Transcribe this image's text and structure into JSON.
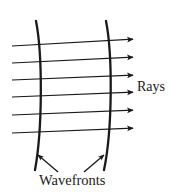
{
  "figure": {
    "background_color": "#ffffff",
    "ink_color": "#1a1a1a",
    "width": 171,
    "height": 192
  },
  "labels": {
    "rays": "Rays",
    "wavefronts": "Wavefronts"
  },
  "chart_data": {
    "type": "diagram",
    "elements": {
      "rays": {
        "count": 6,
        "direction": "left-to-right",
        "arrowhead": "right",
        "label": "Rays",
        "lines": [
          {
            "x1": 12,
            "y1": 46,
            "x2": 137,
            "y2": 39
          },
          {
            "x1": 12,
            "y1": 63,
            "x2": 137,
            "y2": 57
          },
          {
            "x1": 12,
            "y1": 80,
            "x2": 137,
            "y2": 75
          },
          {
            "x1": 12,
            "y1": 97,
            "x2": 137,
            "y2": 92
          },
          {
            "x1": 12,
            "y1": 115,
            "x2": 137,
            "y2": 110
          },
          {
            "x1": 12,
            "y1": 133,
            "x2": 137,
            "y2": 128
          }
        ]
      },
      "wavefronts": {
        "count": 2,
        "orientation": "near-vertical, slightly convex right",
        "label": "Wavefronts",
        "curves": [
          {
            "top": [
              36,
              21
            ],
            "mid": [
              41,
              95
            ],
            "bottom": [
              35,
              170
            ]
          },
          {
            "top": [
              106,
              21
            ],
            "mid": [
              111,
              95
            ],
            "bottom": [
              104,
              170
            ]
          }
        ]
      },
      "pointer_arrows": [
        {
          "from": [
            58,
            172
          ],
          "to": [
            38,
            155
          ],
          "points_to": "left-wavefront"
        },
        {
          "from": [
            84,
            172
          ],
          "to": [
            104,
            155
          ],
          "points_to": "right-wavefront"
        }
      ]
    },
    "axis": {
      "show": false
    },
    "grid": false,
    "legend": {
      "show": false
    }
  }
}
